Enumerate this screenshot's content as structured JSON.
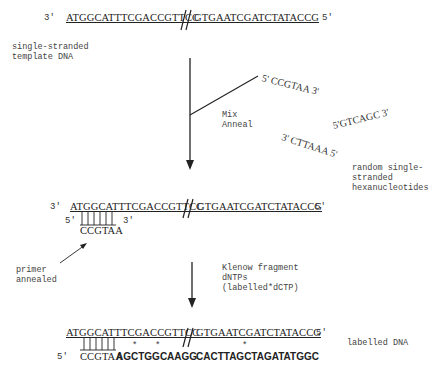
{
  "template": {
    "end_left": "3'",
    "seq_left": "ATGGCATTTCGACCGTTCC",
    "seq_right": "GTGAATCGATCTATACCG",
    "end_right": "5'",
    "label": "single-stranded\ntemplate DNA"
  },
  "step1": {
    "label": "Mix\nAnneal"
  },
  "hexamers": {
    "items": [
      {
        "five": "5'",
        "seq": "CCGTAA",
        "three": "3'"
      },
      {
        "five": "5'",
        "seq": "GTCAGC",
        "three": "3'"
      },
      {
        "three": "3'",
        "seq": "CTTAAA",
        "five": "5'"
      }
    ],
    "label": "random single-\nstranded\nhexanucleotides"
  },
  "annealed": {
    "end_left": "3'",
    "seq_left": "ATGGCATTTCGACCGTTCC",
    "seq_right": "GTGAATCGATCTATACCG",
    "end_right": "5'",
    "primer_five": "5'",
    "primer_seq": "CCGTAA",
    "primer_three": "3'",
    "label": "primer\nannealed"
  },
  "step2": {
    "label": "Klenow fragment\ndNTPs\n(labelled*dCTP)"
  },
  "labelled": {
    "seq_left": "ATGGCATTTCGACCGTTCC",
    "seq_right": "GTGAATCGATCTATACCG",
    "end_right": "5'",
    "new_five": "5'",
    "primer_seq": "CCGTAA",
    "ext1": "AGCTGGCAAGG",
    "ext2": "CACTTAGCTAGATATGGC",
    "asterisk": "*",
    "label": "labelled DNA"
  }
}
